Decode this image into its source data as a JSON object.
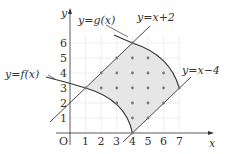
{
  "diagram": {
    "type": "coordinate-plane-region",
    "axes": {
      "x_label": "x",
      "y_label": "y",
      "origin_label": "O",
      "x_ticks": [
        "1",
        "2",
        "3",
        "4",
        "5",
        "6",
        "7"
      ],
      "y_ticks": [
        "1",
        "2",
        "3",
        "4",
        "5",
        "6"
      ]
    },
    "curves": {
      "f_label": "y=f(x)",
      "g_label": "y=g(x)",
      "line1_label": "y=x+2",
      "line2_label": "y=x−4"
    },
    "key_points": [
      {
        "name": "f ∩ (y=x+2)",
        "x": 1,
        "y": 3
      },
      {
        "name": "g ∩ (y=x+2)",
        "x": 4,
        "y": 6
      },
      {
        "name": "f ∩ (y=x−4)",
        "x": 4,
        "y": 0
      },
      {
        "name": "g ∩ (y=x−4)",
        "x": 7,
        "y": 3
      }
    ],
    "lattice_points": [
      [
        4,
        5
      ],
      [
        5,
        5
      ],
      [
        3,
        5
      ],
      [
        2,
        4
      ],
      [
        3,
        4
      ],
      [
        4,
        4
      ],
      [
        5,
        4
      ],
      [
        6,
        4
      ],
      [
        2,
        3
      ],
      [
        3,
        3
      ],
      [
        4,
        3
      ],
      [
        5,
        3
      ],
      [
        6,
        3
      ],
      [
        7,
        3
      ],
      [
        3,
        2
      ],
      [
        4,
        2
      ],
      [
        5,
        2
      ],
      [
        6,
        2
      ],
      [
        4,
        1
      ],
      [
        5,
        1
      ],
      [
        4,
        0
      ],
      [
        1,
        3
      ],
      [
        4,
        6
      ]
    ],
    "colors": {
      "region_fill": "#e6e6e6",
      "curve": "#333333",
      "grid": "#cccccc",
      "dot": "#777777"
    }
  }
}
